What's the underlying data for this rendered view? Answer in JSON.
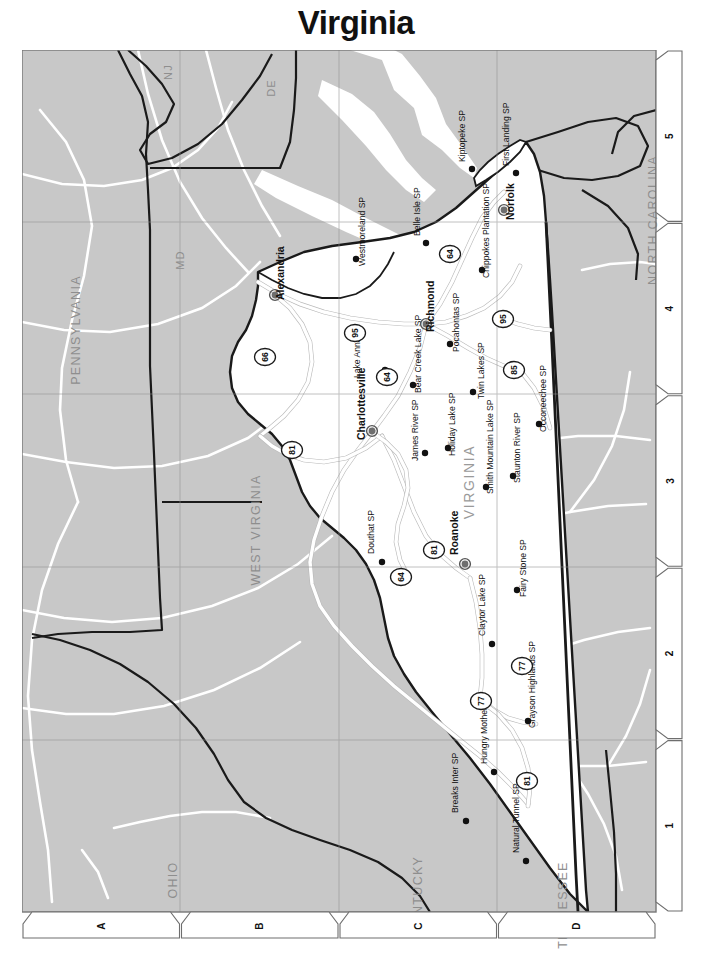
{
  "title": "Virginia",
  "map": {
    "state_label": "VIRGINIA",
    "neighbor_states": [
      {
        "name": "NJ",
        "x": 150,
        "y": 22,
        "size": "sm"
      },
      {
        "name": "DE",
        "x": 253,
        "y": 38,
        "size": "sm"
      },
      {
        "name": "MD",
        "x": 162,
        "y": 210,
        "size": "sm"
      },
      {
        "name": "PENNSYLVANIA",
        "x": 58,
        "y": 280,
        "size": "lg"
      },
      {
        "name": "WEST VIRGINIA",
        "x": 238,
        "y": 480,
        "size": "lg"
      },
      {
        "name": "OHIO",
        "x": 155,
        "y": 830,
        "size": "lg"
      },
      {
        "name": "KENTUCKY",
        "x": 400,
        "y": 845,
        "size": "lg"
      },
      {
        "name": "TENNESSEE",
        "x": 545,
        "y": 855,
        "size": "lg"
      },
      {
        "name": "NORTH CAROLINA",
        "x": 635,
        "y": 170,
        "size": "lg"
      }
    ],
    "cities": [
      {
        "name": "Alexandria",
        "x": 253,
        "y": 245,
        "lx": 262,
        "ly": 250
      },
      {
        "name": "Richmond",
        "x": 404,
        "y": 274,
        "lx": 412,
        "ly": 282
      },
      {
        "name": "Norfolk",
        "x": 482,
        "y": 160,
        "lx": 492,
        "ly": 170
      },
      {
        "name": "Charlottesville",
        "x": 350,
        "y": 381,
        "lx": 343,
        "ly": 390
      },
      {
        "name": "Roanoke",
        "x": 443,
        "y": 514,
        "lx": 436,
        "ly": 505
      }
    ],
    "parks": [
      {
        "name": "Kiptopeke SP",
        "x": 450,
        "y": 119,
        "lx": 443,
        "ly": 112
      },
      {
        "name": "First Landing SP",
        "x": 494,
        "y": 123,
        "lx": 487,
        "ly": 116
      },
      {
        "name": "Westmoreland SP",
        "x": 334,
        "y": 209,
        "lx": 343,
        "ly": 216
      },
      {
        "name": "Belle Isle SP",
        "x": 404,
        "y": 193,
        "lx": 398,
        "ly": 186
      },
      {
        "name": "Chippokes Plantation SP",
        "x": 460,
        "y": 220,
        "lx": 467,
        "ly": 228
      },
      {
        "name": "Lake Anna SP",
        "x": 363,
        "y": 320,
        "lx": 338,
        "ly": 328
      },
      {
        "name": "Pocahontas SP",
        "x": 428,
        "y": 294,
        "lx": 437,
        "ly": 302
      },
      {
        "name": "Twin Lakes SP",
        "x": 451,
        "y": 342,
        "lx": 462,
        "ly": 349
      },
      {
        "name": "Bear Creek Lake SP",
        "x": 391,
        "y": 335,
        "lx": 399,
        "ly": 343
      },
      {
        "name": "James River SP",
        "x": 403,
        "y": 403,
        "lx": 396,
        "ly": 411
      },
      {
        "name": "Holiday Lake SP",
        "x": 426,
        "y": 398,
        "lx": 433,
        "ly": 406
      },
      {
        "name": "Smith Mountain Lake SP",
        "x": 464,
        "y": 437,
        "lx": 471,
        "ly": 444
      },
      {
        "name": "Staunton River SP",
        "x": 491,
        "y": 426,
        "lx": 498,
        "ly": 433
      },
      {
        "name": "Occoneechee SP",
        "x": 517,
        "y": 374,
        "lx": 524,
        "ly": 382
      },
      {
        "name": "Douthat SP",
        "x": 360,
        "y": 512,
        "lx": 352,
        "ly": 504
      },
      {
        "name": "Fairy Stone SP",
        "x": 495,
        "y": 540,
        "lx": 504,
        "ly": 547
      },
      {
        "name": "Claytor Lake SP",
        "x": 470,
        "y": 594,
        "lx": 463,
        "ly": 586
      },
      {
        "name": "Grayson Highlands SP",
        "x": 506,
        "y": 671,
        "lx": 513,
        "ly": 678
      },
      {
        "name": "Hungry Mother SP",
        "x": 472,
        "y": 722,
        "lx": 465,
        "ly": 714
      },
      {
        "name": "Breaks Inter SP",
        "x": 444,
        "y": 771,
        "lx": 436,
        "ly": 763
      },
      {
        "name": "Natural Tunnel SP",
        "x": 504,
        "y": 811,
        "lx": 497,
        "ly": 803
      }
    ],
    "interstates": [
      {
        "number": "95",
        "x": 333,
        "y": 283
      },
      {
        "number": "95",
        "x": 481,
        "y": 269
      },
      {
        "number": "66",
        "x": 243,
        "y": 307
      },
      {
        "number": "64",
        "x": 365,
        "y": 327
      },
      {
        "number": "64",
        "x": 428,
        "y": 204
      },
      {
        "number": "85",
        "x": 492,
        "y": 320
      },
      {
        "number": "81",
        "x": 270,
        "y": 400
      },
      {
        "number": "81",
        "x": 412,
        "y": 500
      },
      {
        "number": "64",
        "x": 379,
        "y": 527
      },
      {
        "number": "77",
        "x": 459,
        "y": 651
      },
      {
        "number": "77",
        "x": 500,
        "y": 616
      },
      {
        "number": "81",
        "x": 505,
        "y": 731
      }
    ],
    "grid": {
      "letters": [
        "A",
        "B",
        "C",
        "D"
      ],
      "numbers": [
        "5",
        "4",
        "3",
        "2",
        "1"
      ]
    }
  },
  "colors": {
    "neighbor_fill": "#c8c8c8",
    "state_fill": "#ffffff",
    "road": "#ffffff",
    "interstate": "#e8e8e8",
    "border": "#1a1a1a",
    "grid_line": "#a8a8a8",
    "label_gray": "#8e8e8e"
  }
}
